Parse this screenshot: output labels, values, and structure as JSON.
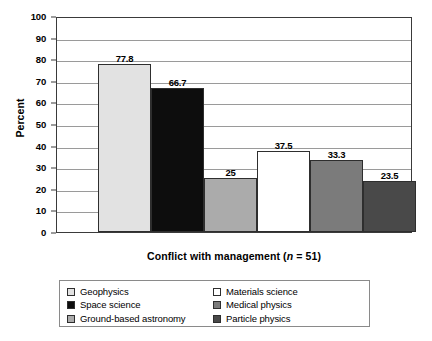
{
  "chart_data": {
    "type": "bar",
    "title": "",
    "subtitle": "",
    "xlabel": "Conflict with management (n = 51)",
    "xlabel_prefix": "Conflict with management (",
    "xlabel_italic": "n",
    "xlabel_suffix": " = 51)",
    "ylabel": "Percent",
    "ylim": [
      0,
      100
    ],
    "ytick_step": 10,
    "yticks": [
      "0",
      "10",
      "20",
      "30",
      "40",
      "50",
      "60",
      "70",
      "80",
      "90",
      "100"
    ],
    "grid": "horizontal",
    "legend_position": "below-plot",
    "categories": [
      "Geophysics",
      "Space science",
      "Ground-based astronomy",
      "Materials science",
      "Medical physics",
      "Particle physics"
    ],
    "values": [
      77.8,
      66.7,
      25,
      37.5,
      33.3,
      23.5
    ],
    "value_labels": [
      "77.8",
      "66.7",
      "25",
      "37.5",
      "33.3",
      "23.5"
    ],
    "colors": [
      "#e2e2e2",
      "#0d0d0d",
      "#ababab",
      "#ffffff",
      "#7b7b7b",
      "#494949"
    ],
    "bar_edge_color": "#2e2e2e",
    "axis_color": "#3a3a3a",
    "gridline_color": "#9a9a9a"
  },
  "legend": {
    "left_column": [
      {
        "label": "Geophysics",
        "color": "#e2e2e2"
      },
      {
        "label": "Space science",
        "color": "#0d0d0d"
      },
      {
        "label": "Ground-based astronomy",
        "color": "#ababab"
      }
    ],
    "right_column": [
      {
        "label": "Materials science",
        "color": "#ffffff"
      },
      {
        "label": "Medical physics",
        "color": "#7b7b7b"
      },
      {
        "label": "Particle physics",
        "color": "#494949"
      }
    ]
  }
}
